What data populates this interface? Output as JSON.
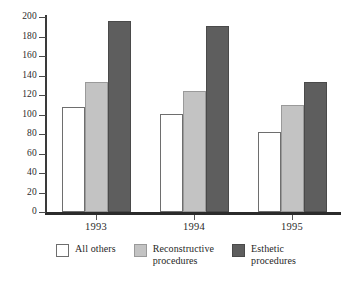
{
  "chart_data": {
    "type": "bar",
    "title": "",
    "subtitle": "",
    "xlabel": "",
    "ylabel": "",
    "categories": [
      "1993",
      "1994",
      "1995"
    ],
    "series": [
      {
        "name": "All others",
        "values": [
          108,
          101,
          82
        ],
        "color": "#ffffff"
      },
      {
        "name": "Reconstructive procedures",
        "values": [
          133,
          124,
          110
        ],
        "color": "#c3c3c3"
      },
      {
        "name": "Esthetic procedures",
        "values": [
          196,
          191,
          133
        ],
        "color": "#5e5e5e"
      }
    ],
    "ylim": [
      0,
      200
    ],
    "ytick_step": 20,
    "ytick_labels": [
      "0",
      "20",
      "40",
      "60",
      "80",
      "100",
      "120",
      "140",
      "160",
      "180",
      "200"
    ],
    "grid": false,
    "legend_position": "bottom",
    "legend_entries": [
      {
        "label": "All others",
        "swatch": "#ffffff"
      },
      {
        "label": "Reconstructive\nprocedures",
        "swatch": "#c3c3c3"
      },
      {
        "label": "Esthetic\nprocedures",
        "swatch": "#5e5e5e"
      }
    ]
  }
}
